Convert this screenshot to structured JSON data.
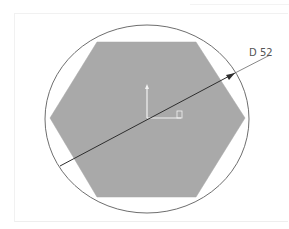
{
  "drawing": {
    "dimension_label": "D 52",
    "shape": "hexagon",
    "circumscribed": "circle",
    "colors": {
      "hexagon_fill": "#a9a9a9",
      "circle_stroke": "#6e6e6e",
      "dimension_line": "#333333",
      "axis_color": "#f2f2f2",
      "background": "#ffffff"
    }
  }
}
